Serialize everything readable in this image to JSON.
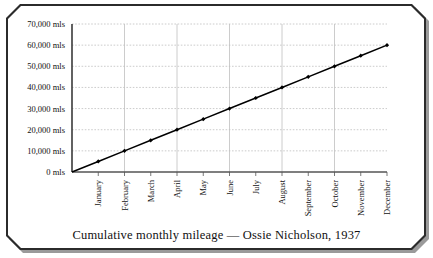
{
  "figure": {
    "caption": "Cumulative monthly mileage — Ossie Nicholson, 1937"
  },
  "chart_data": {
    "type": "line",
    "title": "Cumulative monthly mileage — Ossie Nicholson, 1937",
    "xlabel": "",
    "ylabel": "",
    "categories": [
      "January",
      "February",
      "March",
      "April",
      "May",
      "June",
      "July",
      "August",
      "September",
      "October",
      "November",
      "December"
    ],
    "values": [
      5000,
      10000,
      15000,
      20000,
      25000,
      30000,
      35000,
      40000,
      45000,
      50000,
      55000,
      60000
    ],
    "origin_value": 0,
    "ylim": [
      0,
      70000
    ],
    "ytick_values": [
      0,
      10000,
      20000,
      30000,
      40000,
      50000,
      60000,
      70000
    ],
    "ytick_labels": [
      "0 mls",
      "10,000 mls",
      "20,000 mls",
      "30,000 mls",
      "40,000 mls",
      "50,000 mls",
      "60,000 mls",
      "70,000 mls"
    ],
    "grid": true,
    "grid_style": "dotted",
    "legend": null,
    "marker": "diamond",
    "line_color": "#000000",
    "grid_color": "#bfbfbf",
    "axis_color": "#555555",
    "xtick_rotation": 90
  }
}
